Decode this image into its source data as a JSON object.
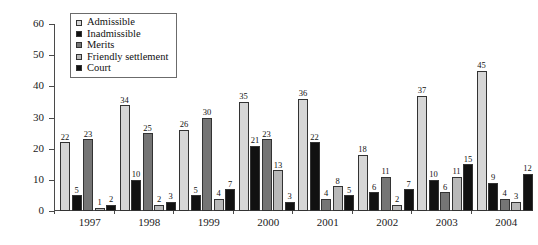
{
  "chart_data": {
    "type": "bar",
    "title": "",
    "subtitle": "",
    "xlabel": "",
    "ylabel": "",
    "ylim": [
      0,
      60
    ],
    "ytick_step": 10,
    "yticks": [
      0,
      10,
      20,
      30,
      40,
      50,
      60
    ],
    "grid": false,
    "legend_position": "top-left",
    "categories": [
      "1997",
      "1998",
      "1999",
      "2000",
      "2001",
      "2002",
      "2003",
      "2004"
    ],
    "series": [
      {
        "name": "Admissible",
        "color": "#d6d6d6",
        "values": [
          22,
          34,
          26,
          35,
          36,
          18,
          37,
          45
        ]
      },
      {
        "name": "Inadmissible",
        "color": "#111111",
        "values": [
          5,
          10,
          5,
          21,
          22,
          6,
          10,
          9
        ]
      },
      {
        "name": "Merits",
        "color": "#757575",
        "values": [
          23,
          25,
          30,
          23,
          4,
          11,
          6,
          4
        ]
      },
      {
        "name": "Friendly settlement",
        "color": "#b8b8b8",
        "values": [
          1,
          2,
          4,
          13,
          8,
          2,
          11,
          3
        ]
      },
      {
        "name": "Court",
        "color": "#111111",
        "values": [
          2,
          3,
          7,
          3,
          5,
          7,
          15,
          12
        ]
      }
    ]
  },
  "legend": {
    "items": [
      {
        "label": "Admissible"
      },
      {
        "label": "Inadmissible"
      },
      {
        "label": "Merits"
      },
      {
        "label": "Friendly settlement"
      },
      {
        "label": "Court"
      }
    ]
  },
  "axes": {
    "y_tick_labels": [
      "0",
      "10",
      "20",
      "30",
      "40",
      "50",
      "60"
    ],
    "x_tick_labels": [
      "1997",
      "1998",
      "1999",
      "2000",
      "2001",
      "2002",
      "2003",
      "2004"
    ]
  }
}
